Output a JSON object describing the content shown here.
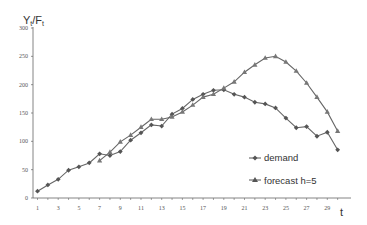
{
  "chart_data": {
    "type": "line",
    "title": "",
    "xlabel": "t",
    "ylabel": "Y_t/F_t",
    "ylabel_main": "Y",
    "ylabel_sub1": "t",
    "ylabel_sep": "/F",
    "ylabel_sub2": "t",
    "xlim": [
      1,
      30
    ],
    "ylim": [
      0,
      300
    ],
    "yticks": [
      0,
      50,
      100,
      150,
      200,
      250,
      300
    ],
    "xticks": [
      1,
      3,
      5,
      7,
      9,
      11,
      13,
      15,
      17,
      19,
      21,
      23,
      25,
      27,
      29
    ],
    "grid": false,
    "legend_position": "lower right",
    "series": [
      {
        "name": "demand",
        "marker": "diamond",
        "x": [
          1,
          2,
          3,
          4,
          5,
          6,
          7,
          8,
          9,
          10,
          11,
          12,
          13,
          14,
          15,
          16,
          17,
          18,
          19,
          20,
          21,
          22,
          23,
          24,
          25,
          26,
          27,
          28,
          29,
          30
        ],
        "values": [
          12,
          23,
          33,
          49,
          55,
          62,
          78,
          75,
          82,
          102,
          115,
          129,
          127,
          148,
          158,
          174,
          183,
          190,
          191,
          183,
          178,
          169,
          166,
          159,
          141,
          124,
          126,
          109,
          116,
          85
        ]
      },
      {
        "name": "forecast h=5",
        "marker": "triangle",
        "x": [
          7,
          8,
          9,
          10,
          11,
          12,
          13,
          14,
          15,
          16,
          17,
          18,
          19,
          20,
          21,
          22,
          23,
          24,
          25,
          26,
          27,
          28,
          29,
          30
        ],
        "values": [
          66,
          81,
          99,
          111,
          125,
          139,
          139,
          143,
          152,
          164,
          178,
          183,
          194,
          205,
          222,
          235,
          247,
          250,
          240,
          224,
          203,
          178,
          152,
          118
        ]
      }
    ]
  }
}
